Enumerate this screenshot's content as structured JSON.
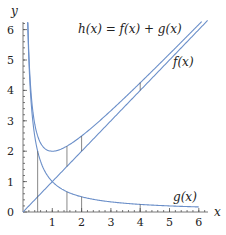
{
  "chart_data": {
    "type": "line",
    "title": "",
    "xlabel": "x",
    "ylabel": "y",
    "xlim": [
      0,
      6.3
    ],
    "ylim": [
      0,
      6.3
    ],
    "x_ticks": [
      "1",
      "2",
      "3",
      "4",
      "5",
      "6"
    ],
    "y_ticks": [
      "0",
      "1",
      "2",
      "3",
      "4",
      "5",
      "6"
    ],
    "grid": false,
    "series": [
      {
        "name": "f(x)",
        "formula": "x",
        "x": [
          0,
          1,
          2,
          3,
          4,
          5,
          6
        ],
        "values": [
          0,
          1,
          2,
          3,
          4,
          5,
          6
        ]
      },
      {
        "name": "g(x)",
        "formula": "1/x",
        "x": [
          0.16,
          0.5,
          1,
          1.5,
          2,
          4,
          6
        ],
        "values": [
          6.25,
          2,
          1,
          0.667,
          0.5,
          0.25,
          0.167
        ]
      },
      {
        "name": "h(x) = f(x) + g(x)",
        "formula": "x + 1/x",
        "x": [
          0.16,
          0.5,
          1,
          1.5,
          2,
          4,
          6
        ],
        "values": [
          6.41,
          2.5,
          2,
          2.167,
          2.5,
          4.25,
          6.167
        ]
      }
    ],
    "annotations": [
      "h(x) = f(x) + g(x)",
      "f(x)",
      "g(x)",
      "vertical segments at x = 0.5, 1.5, 2, 4 showing g(x) added to f(x)"
    ]
  },
  "labels": {
    "y_axis": "y",
    "x_axis": "x",
    "h": "h(x) = f(x) + g(x)",
    "f": "f(x)",
    "g": "g(x)"
  }
}
